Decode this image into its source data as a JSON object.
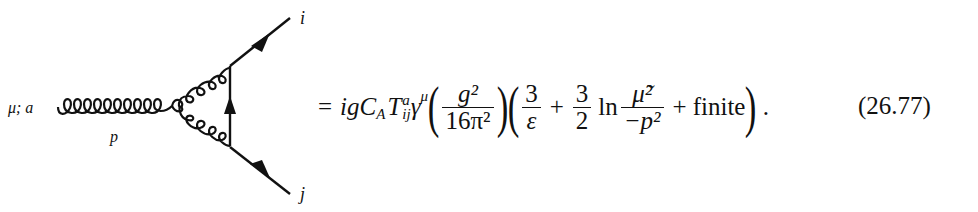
{
  "diagram": {
    "external_gluon_label": "μ; a",
    "momentum_label": "p",
    "outgoing_quark_label": "i",
    "incoming_quark_label": "j"
  },
  "equation": {
    "equals": "=",
    "prefactor": "igC",
    "ca_sub": "A",
    "T": "T",
    "T_sup": "a",
    "T_sub": "ij",
    "gamma": "γ",
    "gamma_sup": "μ",
    "frac1_num": "g²",
    "frac1_den": "16π²",
    "frac2_num": "3",
    "frac2_den": "ε",
    "plus1": "+",
    "frac3_num": "3",
    "frac3_den": "2",
    "ln": "ln",
    "frac4_num": "μ̃²",
    "frac4_den": "−p²",
    "plus2": "+",
    "finite": "finite",
    "period": ".",
    "number": "(26.77)"
  }
}
